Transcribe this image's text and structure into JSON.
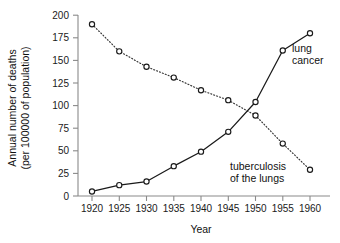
{
  "chart_data": {
    "type": "line",
    "title": "",
    "xlabel": "Year",
    "ylabel": "Annual number of deaths (per 100000 of population)",
    "ylabel_line1": "Annual number of deaths",
    "ylabel_line2": "(per 100000 of population)",
    "x": [
      1920,
      1925,
      1930,
      1935,
      1940,
      1945,
      1950,
      1955,
      1960
    ],
    "xticks": [
      "1920",
      "1925",
      "1930",
      "1935",
      "1940",
      "1945",
      "1950",
      "1955",
      "1960"
    ],
    "yticks": [
      "0",
      "25",
      "50",
      "75",
      "100",
      "125",
      "150",
      "175",
      "200"
    ],
    "ytick_values": [
      0,
      25,
      50,
      75,
      100,
      125,
      150,
      175,
      200
    ],
    "xlim": [
      1915,
      1962
    ],
    "ylim": [
      0,
      200
    ],
    "grid": false,
    "legend_position": "inline-annotations",
    "series": [
      {
        "name": "lung cancer",
        "label_line1": "lung",
        "label_line2": "cancer",
        "style": "solid",
        "marker": "open-circle",
        "color": "#1a1a1a",
        "values": [
          5,
          12,
          16,
          33,
          49,
          71,
          104,
          161,
          180
        ]
      },
      {
        "name": "tuberculosis of the lungs",
        "label_line1": "tuberculosis",
        "label_line2": "of the lungs",
        "style": "dotted",
        "marker": "open-circle",
        "color": "#333333",
        "values": [
          190,
          160,
          143,
          131,
          117,
          106,
          89,
          58,
          29
        ]
      }
    ]
  }
}
